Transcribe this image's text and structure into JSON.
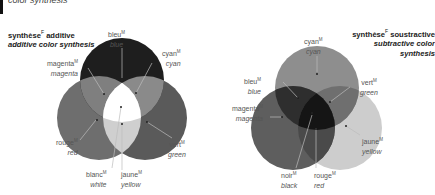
{
  "page": {
    "top_title": "color synthesis"
  },
  "additive": {
    "heading_fr": "synthèse",
    "heading_fr_gender": "F",
    "heading_fr_rest": "additive",
    "heading_en": "additive color synthesis",
    "labels": [
      {
        "fr": "bleu",
        "gender": "M",
        "en": "blue"
      },
      {
        "fr": "cyan",
        "gender": "M",
        "en": "cyan"
      },
      {
        "fr": "magenta",
        "gender": "M",
        "en": "magenta"
      },
      {
        "fr": "rouge",
        "gender": "M",
        "en": "red"
      },
      {
        "fr": "vert",
        "gender": "M",
        "en": "green"
      },
      {
        "fr": "blanc",
        "gender": "M",
        "en": "white"
      },
      {
        "fr": "jaune",
        "gender": "M",
        "en": "yellow"
      }
    ],
    "colors": {
      "blue": "#1e1e1e",
      "red": "#6d6d6d",
      "green": "#5a5a5a",
      "overlap_magenta": "#7f7f7f",
      "overlap_cyan": "#8a8a8a",
      "overlap_yellow": "#cfcfcf",
      "white": "#ffffff"
    }
  },
  "subtractive": {
    "heading_fr": "synthèse",
    "heading_fr_gender": "F",
    "heading_fr_rest": "soustractive",
    "heading_en_line1": "subtractive color",
    "heading_en_line2": "synthesis",
    "labels": [
      {
        "fr": "cyan",
        "gender": "M",
        "en": "cyan"
      },
      {
        "fr": "bleu",
        "gender": "M",
        "en": "blue"
      },
      {
        "fr": "vert",
        "gender": "M",
        "en": "green"
      },
      {
        "fr": "magenta",
        "gender": "M",
        "en": "magenta"
      },
      {
        "fr": "jaune",
        "gender": "M",
        "en": "yellow"
      },
      {
        "fr": "noir",
        "gender": "M",
        "en": "black"
      },
      {
        "fr": "rouge",
        "gender": "M",
        "en": "red"
      }
    ],
    "colors": {
      "cyan": "#8e8e8e",
      "magenta": "#5e5e5e",
      "yellow": "#cdcdcd",
      "black": "#1a1a1a"
    }
  }
}
